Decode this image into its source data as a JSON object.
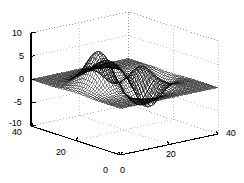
{
  "figure": {
    "title": "",
    "background_color": "#ffffff",
    "width": 244,
    "height": 183
  },
  "chart_data": {
    "type": "surface",
    "render": "wireframe-mesh",
    "title": "",
    "xlabel": "",
    "ylabel": "",
    "zlabel": "",
    "function": "peaks",
    "grid_size": 49,
    "xlim": [
      0,
      48
    ],
    "ylim": [
      0,
      48
    ],
    "zlim": [
      -10,
      10
    ],
    "xticks": [
      0,
      20,
      40
    ],
    "xtick_labels": [
      "0",
      "20",
      "40"
    ],
    "yticks": [
      0,
      20,
      40
    ],
    "ytick_labels": [
      "0",
      "20",
      "40"
    ],
    "zticks": [
      -10,
      -5,
      0,
      5,
      10
    ],
    "ztick_labels": [
      "-10",
      "-5",
      "0",
      "5",
      "10"
    ],
    "grid": true,
    "gridline_style": "dotted",
    "gridline_color": "#9a9a9a",
    "axis_color": "#000000",
    "mesh_color": "#000000",
    "legend": null,
    "view_azimuth": -37.5,
    "view_elevation": 30,
    "zmax_observed": 8.1,
    "zmin_observed": -6.5,
    "peaks": [
      {
        "label": "global-maximum",
        "x": 16,
        "y": 32,
        "z": 8.1
      },
      {
        "label": "secondary-maximum",
        "x": 24,
        "y": 22,
        "z": 3.6
      },
      {
        "label": "global-minimum",
        "x": 32,
        "y": 14,
        "z": -6.5
      },
      {
        "label": "secondary-minimum",
        "x": 20,
        "y": 10,
        "z": -3.0
      }
    ]
  },
  "axes": {
    "z_axis": {
      "name": "z-axis",
      "labels": [
        "10",
        "5",
        "0",
        "-5",
        "-10"
      ],
      "positions_y": [
        33,
        56,
        79,
        102,
        125
      ]
    },
    "y_axis": {
      "name": "y-axis-left",
      "labels": [
        "40",
        "20",
        "0"
      ]
    },
    "x_axis": {
      "name": "x-axis-right",
      "labels": [
        "0",
        "20",
        "40"
      ]
    }
  },
  "labels": [
    {
      "id": "z-10",
      "text": "10",
      "x": 12,
      "y": 29,
      "name": "ztick-label-10"
    },
    {
      "id": "z-5",
      "text": "5",
      "x": 19,
      "y": 52,
      "name": "ztick-label-5"
    },
    {
      "id": "z-0",
      "text": "0",
      "x": 19,
      "y": 75,
      "name": "ztick-label-0"
    },
    {
      "id": "z-m5",
      "text": "-5",
      "x": 14,
      "y": 98,
      "name": "ztick-label-minus-5"
    },
    {
      "id": "z-m10",
      "text": "-10",
      "x": 9,
      "y": 119,
      "name": "ztick-label-minus-10"
    },
    {
      "id": "y-40",
      "text": "40",
      "x": 12,
      "y": 128,
      "name": "ytick-label-40"
    },
    {
      "id": "y-20",
      "text": "20",
      "x": 56,
      "y": 148,
      "name": "ytick-label-20"
    },
    {
      "id": "y-0",
      "text": "0",
      "x": 103,
      "y": 166,
      "name": "ytick-label-0"
    },
    {
      "id": "x-0",
      "text": "0",
      "x": 120,
      "y": 166,
      "name": "xtick-label-0"
    },
    {
      "id": "x-20",
      "text": "20",
      "x": 166,
      "y": 150,
      "name": "xtick-label-20"
    },
    {
      "id": "x-40",
      "text": "40",
      "x": 226,
      "y": 129,
      "name": "xtick-label-40"
    }
  ]
}
